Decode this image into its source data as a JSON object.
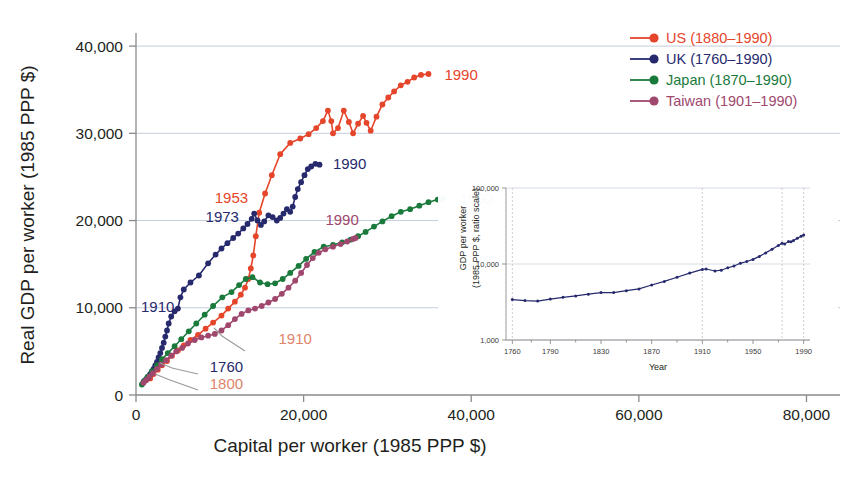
{
  "figure": {
    "background_color": "#ffffff",
    "text_color": "#231f20",
    "grid_color": "#c3cddb"
  },
  "chart_data": {
    "type": "line",
    "title": "",
    "xlabel": "Capital per worker (1985 PPP $)",
    "ylabel": "Real GDP per worker (1985 PPP $)",
    "xlim": [
      0,
      84000
    ],
    "ylim": [
      0,
      41500
    ],
    "xticks": [
      0,
      20000,
      40000,
      60000,
      80000
    ],
    "xticklabels": [
      "0",
      "20,000",
      "40,000",
      "60,000",
      "80,000"
    ],
    "yticks": [
      0,
      10000,
      20000,
      30000,
      40000
    ],
    "yticklabels": [
      "0",
      "10,000",
      "20,000",
      "30,000",
      "40,000"
    ],
    "grid": "horizontal",
    "legend_position": "top-right",
    "marker": "circle",
    "series": [
      {
        "name": "US (1880–1990)",
        "label": "US (1880–1990)",
        "color": "#e5452b",
        "points": [
          [
            1700,
            1900
          ],
          [
            2100,
            2400
          ],
          [
            2600,
            2900
          ],
          [
            3100,
            3400
          ],
          [
            3700,
            3900
          ],
          [
            4300,
            4500
          ],
          [
            5000,
            5100
          ],
          [
            5700,
            5700
          ],
          [
            6500,
            6300
          ],
          [
            7400,
            6900
          ],
          [
            8300,
            7600
          ],
          [
            9200,
            8300
          ],
          [
            10200,
            9100
          ],
          [
            11000,
            9900
          ],
          [
            11800,
            10700
          ],
          [
            12500,
            11500
          ],
          [
            13000,
            12300
          ],
          [
            13400,
            13300
          ],
          [
            13700,
            14500
          ],
          [
            14000,
            16000
          ],
          [
            14300,
            18200
          ],
          [
            14700,
            20900
          ],
          [
            15400,
            23100
          ],
          [
            16200,
            25200
          ],
          [
            17200,
            27600
          ],
          [
            18400,
            28900
          ],
          [
            19600,
            29400
          ],
          [
            20600,
            29900
          ],
          [
            21500,
            30600
          ],
          [
            22300,
            31400
          ],
          [
            22900,
            32600
          ],
          [
            23300,
            31400
          ],
          [
            23500,
            30000
          ],
          [
            24100,
            30600
          ],
          [
            24800,
            32600
          ],
          [
            25400,
            31300
          ],
          [
            25900,
            30000
          ],
          [
            26500,
            31100
          ],
          [
            27100,
            32000
          ],
          [
            27500,
            31200
          ],
          [
            28000,
            30300
          ],
          [
            28700,
            31900
          ],
          [
            29400,
            33300
          ],
          [
            30100,
            34100
          ],
          [
            30800,
            34800
          ],
          [
            31600,
            35500
          ],
          [
            32400,
            35900
          ],
          [
            33200,
            36400
          ],
          [
            34000,
            36700
          ],
          [
            34900,
            36800
          ]
        ],
        "endpoint_label": "1990"
      },
      {
        "name": "UK (1760–1990)",
        "label": "UK (1760–1990)",
        "color": "#262a6d",
        "points": [
          [
            900,
            1500
          ],
          [
            1100,
            1700
          ],
          [
            1300,
            1900
          ],
          [
            1500,
            2100
          ],
          [
            1700,
            2400
          ],
          [
            1900,
            2700
          ],
          [
            2100,
            3000
          ],
          [
            2300,
            3400
          ],
          [
            2500,
            3800
          ],
          [
            2700,
            4300
          ],
          [
            2900,
            4800
          ],
          [
            3100,
            5400
          ],
          [
            3300,
            6000
          ],
          [
            3500,
            6700
          ],
          [
            3700,
            7400
          ],
          [
            3900,
            8200
          ],
          [
            4200,
            9000
          ],
          [
            4600,
            9600
          ],
          [
            5000,
            9900
          ],
          [
            5300,
            11200
          ],
          [
            5700,
            12100
          ],
          [
            6500,
            12900
          ],
          [
            7500,
            13700
          ],
          [
            8600,
            15100
          ],
          [
            9500,
            16100
          ],
          [
            10200,
            16800
          ],
          [
            10900,
            17400
          ],
          [
            11600,
            18000
          ],
          [
            12200,
            18500
          ],
          [
            12800,
            19100
          ],
          [
            13300,
            19600
          ],
          [
            13800,
            20200
          ],
          [
            14100,
            20800
          ],
          [
            14500,
            20000
          ],
          [
            14900,
            19500
          ],
          [
            15300,
            19900
          ],
          [
            15800,
            20600
          ],
          [
            16300,
            20400
          ],
          [
            16800,
            20000
          ],
          [
            17200,
            20300
          ],
          [
            17600,
            20800
          ],
          [
            18000,
            21300
          ],
          [
            18400,
            21000
          ],
          [
            18700,
            21600
          ],
          [
            19000,
            22700
          ],
          [
            19300,
            23600
          ],
          [
            19700,
            24400
          ],
          [
            20100,
            25200
          ],
          [
            20500,
            25900
          ],
          [
            20900,
            26200
          ],
          [
            21400,
            26500
          ],
          [
            21900,
            26400
          ]
        ],
        "endpoint_label": "1990"
      },
      {
        "name": "Japan (1870–1990)",
        "label": "Japan (1870–1990)",
        "color": "#1a7a3c",
        "points": [
          [
            700,
            1200
          ],
          [
            1000,
            1600
          ],
          [
            1400,
            2100
          ],
          [
            1900,
            2700
          ],
          [
            2500,
            3400
          ],
          [
            3100,
            4100
          ],
          [
            3800,
            4800
          ],
          [
            4600,
            5600
          ],
          [
            5400,
            6400
          ],
          [
            6300,
            7300
          ],
          [
            7200,
            8200
          ],
          [
            8200,
            9200
          ],
          [
            9200,
            10200
          ],
          [
            10300,
            11200
          ],
          [
            11400,
            11800
          ],
          [
            12300,
            12600
          ],
          [
            13100,
            13300
          ],
          [
            13900,
            13500
          ],
          [
            14800,
            12900
          ],
          [
            15700,
            12700
          ],
          [
            16600,
            12800
          ],
          [
            17500,
            13300
          ],
          [
            18400,
            14000
          ],
          [
            19400,
            14800
          ],
          [
            20300,
            15600
          ],
          [
            21300,
            16400
          ],
          [
            22400,
            17000
          ],
          [
            23500,
            17200
          ],
          [
            24600,
            17500
          ],
          [
            25600,
            17800
          ],
          [
            26500,
            18200
          ],
          [
            27400,
            18700
          ],
          [
            28400,
            19300
          ],
          [
            29400,
            19900
          ],
          [
            30500,
            20500
          ],
          [
            31600,
            21000
          ],
          [
            32700,
            21300
          ],
          [
            33800,
            21700
          ],
          [
            34900,
            22100
          ],
          [
            36000,
            22400
          ],
          [
            36600,
            22500
          ]
        ],
        "endpoint_label": "1990"
      },
      {
        "name": "Taiwan (1901–1990)",
        "label": "Taiwan (1901–1990)",
        "color": "#a0476e",
        "points": [
          [
            900,
            1400
          ],
          [
            1200,
            1700
          ],
          [
            1600,
            2100
          ],
          [
            2000,
            2500
          ],
          [
            2500,
            3000
          ],
          [
            3000,
            3500
          ],
          [
            3600,
            4000
          ],
          [
            4200,
            4500
          ],
          [
            4800,
            5000
          ],
          [
            5500,
            5400
          ],
          [
            6200,
            5900
          ],
          [
            7000,
            6300
          ],
          [
            7800,
            6600
          ],
          [
            8600,
            6800
          ],
          [
            9400,
            7000
          ],
          [
            10200,
            7400
          ],
          [
            11000,
            8000
          ],
          [
            11800,
            8700
          ],
          [
            12600,
            9300
          ],
          [
            13400,
            9700
          ],
          [
            14200,
            9900
          ],
          [
            15000,
            10200
          ],
          [
            15800,
            10600
          ],
          [
            16600,
            11000
          ],
          [
            17400,
            11600
          ],
          [
            18200,
            12300
          ],
          [
            19000,
            13100
          ],
          [
            19700,
            14000
          ],
          [
            20400,
            14900
          ],
          [
            21100,
            15700
          ],
          [
            21800,
            16300
          ],
          [
            22600,
            16700
          ],
          [
            23500,
            17000
          ],
          [
            24400,
            17300
          ],
          [
            25200,
            17600
          ],
          [
            25900,
            17900
          ],
          [
            26200,
            18000
          ]
        ],
        "endpoint_label": "1990"
      }
    ],
    "annotations": [
      {
        "text": "1990",
        "series": "US (1880–1990)",
        "color": "#e5452b",
        "x": 36800,
        "y": 36700
      },
      {
        "text": "1990",
        "series": "UK (1760–1990)",
        "color": "#262a6d",
        "x": 23500,
        "y": 26500
      },
      {
        "text": "1990",
        "series": "Japan (1870–1990)",
        "color": "#1a7a3c",
        "x": 38600,
        "y": 22500
      },
      {
        "text": "1990",
        "series": "Taiwan (1901–1990)",
        "color": "#a0476e",
        "x": 22600,
        "y": 20100
      },
      {
        "text": "1953",
        "series": "US (1880–1990)",
        "color": "#e5452b",
        "x": 9400,
        "y": 22600
      },
      {
        "text": "1973",
        "series": "UK (1760–1990)",
        "color": "#262a6d",
        "x": 8300,
        "y": 20400
      },
      {
        "text": "1910",
        "series": "UK (1760–1990)",
        "color": "#262a6d",
        "x": 600,
        "y": 10100
      },
      {
        "text": "1910",
        "series": "Taiwan (1901–1990)",
        "color": "#e0846a",
        "x": 17000,
        "y": 6400
      },
      {
        "text": "1760",
        "series": "UK (1760–1990)",
        "color": "#262a6d",
        "x": 8800,
        "y": 3200
      },
      {
        "text": "1800",
        "series": "US (1880–1990)",
        "color": "#e0846a",
        "x": 8800,
        "y": 1300
      }
    ]
  },
  "inset_chart": {
    "type": "line",
    "title": "",
    "xlabel": "Year",
    "ylabel": "GDP per worker\n(1985 PPP $, ratio scale)",
    "ylabel_line1": "GDP per worker",
    "ylabel_line2": "(1985 PPP $, ratio scale)",
    "yscale": "log",
    "ylim": [
      1000,
      100000
    ],
    "yticks": [
      1000,
      10000,
      100000
    ],
    "yticklabels": [
      "1,000",
      "10,000",
      "100,000"
    ],
    "xlim": [
      1755,
      1995
    ],
    "xticks": [
      1760,
      1790,
      1830,
      1870,
      1910,
      1950,
      1990
    ],
    "xticklabels": [
      "1760",
      "1790",
      "1830",
      "1870",
      "1910",
      "1950",
      "1990"
    ],
    "xminorticks": [
      1775,
      1810,
      1850,
      1890,
      1930,
      1970
    ],
    "reference_lines": [
      1760,
      1910,
      1973,
      1990
    ],
    "series_name": "UK GDP per worker",
    "color": "#262a6d",
    "grid": "horizontal",
    "points": [
      [
        1760,
        3400
      ],
      [
        1770,
        3300
      ],
      [
        1780,
        3250
      ],
      [
        1790,
        3450
      ],
      [
        1800,
        3650
      ],
      [
        1810,
        3800
      ],
      [
        1820,
        4000
      ],
      [
        1830,
        4200
      ],
      [
        1840,
        4200
      ],
      [
        1850,
        4450
      ],
      [
        1860,
        4700
      ],
      [
        1870,
        5300
      ],
      [
        1880,
        5900
      ],
      [
        1890,
        6700
      ],
      [
        1900,
        7600
      ],
      [
        1910,
        8500
      ],
      [
        1913,
        8600
      ],
      [
        1920,
        8100
      ],
      [
        1925,
        8300
      ],
      [
        1930,
        8900
      ],
      [
        1935,
        9400
      ],
      [
        1940,
        10200
      ],
      [
        1945,
        10800
      ],
      [
        1950,
        11500
      ],
      [
        1955,
        12600
      ],
      [
        1960,
        14000
      ],
      [
        1965,
        15600
      ],
      [
        1970,
        17500
      ],
      [
        1973,
        18800
      ],
      [
        1975,
        18400
      ],
      [
        1978,
        19800
      ],
      [
        1980,
        19600
      ],
      [
        1982,
        20400
      ],
      [
        1985,
        21800
      ],
      [
        1988,
        23200
      ],
      [
        1990,
        24000
      ]
    ]
  }
}
